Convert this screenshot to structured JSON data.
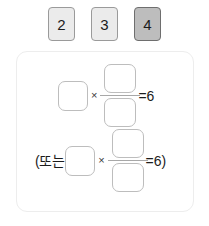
{
  "tiles": [
    {
      "label": "2",
      "selected": false
    },
    {
      "label": "3",
      "selected": false
    },
    {
      "label": "4",
      "selected": true
    }
  ],
  "card": {
    "equations": [
      {
        "id": "equation-1",
        "prefix": "",
        "multiply_sign": "×",
        "numerator_value": "",
        "denominator_value": "",
        "factor_value": "",
        "result": "=6",
        "suffix": ""
      },
      {
        "id": "equation-2",
        "prefix": "(또는",
        "multiply_sign": "×",
        "numerator_value": "",
        "denominator_value": "",
        "factor_value": "",
        "result": "=6",
        "suffix": ")"
      }
    ]
  },
  "colors": {
    "tile_fill": "#ebebeb",
    "tile_selected_fill": "#bdbdbd",
    "tile_border": "#9a9a9a",
    "card_border": "#ededed",
    "box_border": "#bdbdbd",
    "text": "#1c1c1c"
  }
}
